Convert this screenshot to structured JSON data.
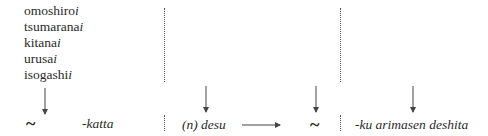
{
  "adjectives": [
    {
      "stem": "omoshiro",
      "ending": "i"
    },
    {
      "stem": "tsumarana",
      "ending": "i"
    },
    {
      "stem": "kitana",
      "ending": "i"
    },
    {
      "stem": "urusa",
      "ending": "i"
    },
    {
      "stem": "isogashi",
      "ending": "i"
    }
  ],
  "bottom_row": {
    "tilde_1": "~",
    "past_affirmative": "-katta",
    "noun_form": "(n) desu",
    "tilde_2": "~",
    "past_negative": "-ku arimasen deshita"
  },
  "arrows": [
    {
      "name": "down-arrow-adjectives",
      "direction": "down"
    },
    {
      "name": "down-arrow-noun-desu",
      "direction": "down"
    },
    {
      "name": "right-arrow-to-tilde",
      "direction": "right"
    },
    {
      "name": "down-arrow-tilde",
      "direction": "down"
    },
    {
      "name": "down-arrow-negative",
      "direction": "down"
    }
  ],
  "colors": {
    "text": "#2a2a2a",
    "line": "#444444"
  }
}
